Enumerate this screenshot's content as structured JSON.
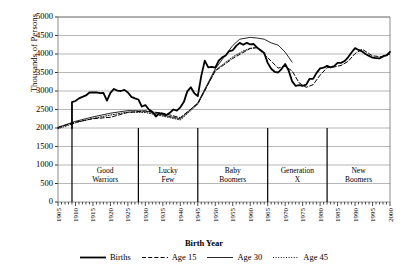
{
  "chart_data": {
    "type": "line",
    "title": "",
    "xlabel": "Birth Year",
    "ylabel": "Thousands of Persons",
    "xlim": [
      1905,
      2000
    ],
    "ylim": [
      0,
      5000
    ],
    "ytick_step": 500,
    "xtick_step": 5,
    "grid": true,
    "legend_position": "bottom",
    "yticks": [
      "0",
      "500",
      "1000",
      "1500",
      "2000",
      "2500",
      "3000",
      "3500",
      "4000",
      "4500",
      "5000"
    ],
    "xticks": [
      "1905",
      "1910",
      "1915",
      "1920",
      "1925",
      "1930",
      "1935",
      "1940",
      "1945",
      "1950",
      "1955",
      "1960",
      "1965",
      "1970",
      "1975",
      "1980",
      "1985",
      "1990",
      "1995",
      "2000"
    ],
    "legend": [
      {
        "name": "Births",
        "style": "solid-thick",
        "color": "#000000"
      },
      {
        "name": "Age 15",
        "style": "dashed",
        "color": "#000000"
      },
      {
        "name": "Age 30",
        "style": "solid-thin",
        "color": "#000000"
      },
      {
        "name": "Age 45",
        "style": "dotted",
        "color": "#000000"
      }
    ],
    "generation_bands": [
      {
        "label_line1": "Good",
        "label_line2": "Warriors",
        "start": 1909,
        "end": 1928
      },
      {
        "label_line1": "Lucky",
        "label_line2": "Few",
        "start": 1928,
        "end": 1945
      },
      {
        "label_line1": "Baby",
        "label_line2": "Boomers",
        "start": 1945,
        "end": 1965
      },
      {
        "label_line1": "Generation",
        "label_line2": "X",
        "start": 1965,
        "end": 1982
      },
      {
        "label_line1": "New",
        "label_line2": "Boomers",
        "start": 1982,
        "end": 2000
      }
    ],
    "series": [
      {
        "name": "Births",
        "style": "solid-thick",
        "x": [
          1909,
          1909,
          1910,
          1911,
          1912,
          1913,
          1914,
          1915,
          1916,
          1917,
          1918,
          1919,
          1920,
          1921,
          1922,
          1923,
          1924,
          1925,
          1926,
          1927,
          1928,
          1929,
          1930,
          1931,
          1932,
          1933,
          1934,
          1935,
          1936,
          1937,
          1938,
          1939,
          1940,
          1941,
          1942,
          1943,
          1944,
          1945,
          1946,
          1947,
          1948,
          1949,
          1950,
          1951,
          1952,
          1953,
          1954,
          1955,
          1956,
          1957,
          1958,
          1959,
          1960,
          1961,
          1962,
          1963,
          1964,
          1965,
          1966,
          1967,
          1968,
          1969,
          1970,
          1971,
          1972,
          1973,
          1974,
          1975,
          1976,
          1977,
          1978,
          1979,
          1980,
          1981,
          1982,
          1983,
          1984,
          1985,
          1986,
          1987,
          1988,
          1989,
          1990,
          1991,
          1992,
          1993,
          1994,
          1995,
          1996,
          1997,
          1998,
          1999,
          2000
        ],
        "y": [
          2000,
          2700,
          2730,
          2800,
          2840,
          2880,
          2960,
          2965,
          2960,
          2940,
          2950,
          2740,
          2950,
          3055,
          3010,
          3000,
          3030,
          2960,
          2840,
          2800,
          2770,
          2580,
          2620,
          2500,
          2440,
          2310,
          2400,
          2380,
          2350,
          2410,
          2500,
          2470,
          2560,
          2700,
          2990,
          3100,
          2940,
          2860,
          3410,
          3820,
          3640,
          3650,
          3630,
          3820,
          3910,
          3960,
          4080,
          4100,
          4220,
          4300,
          4250,
          4300,
          4260,
          4270,
          4170,
          4100,
          4030,
          3760,
          3600,
          3520,
          3500,
          3600,
          3730,
          3550,
          3260,
          3140,
          3160,
          3140,
          3170,
          3330,
          3330,
          3490,
          3610,
          3630,
          3680,
          3640,
          3670,
          3760,
          3760,
          3810,
          3910,
          4040,
          4160,
          4110,
          4070,
          4000,
          3950,
          3900,
          3890,
          3880,
          3940,
          3960,
          4060
        ],
        "note": "Total U.S. births by year, thousands"
      },
      {
        "name": "Age 15",
        "style": "dashed",
        "x": [
          1905,
          1910,
          1915,
          1920,
          1925,
          1930,
          1935,
          1940,
          1945,
          1950,
          1955,
          1960,
          1962,
          1965,
          1968,
          1970,
          1972,
          1974,
          1976,
          1978,
          1980,
          1982,
          1984,
          1986,
          1988,
          1990,
          1992,
          1995,
          1998,
          2000
        ],
        "y": [
          2010,
          2160,
          2250,
          2290,
          2420,
          2460,
          2400,
          2280,
          2660,
          3540,
          3880,
          4150,
          4170,
          3900,
          3620,
          3670,
          3540,
          3220,
          3100,
          3170,
          3430,
          3630,
          3650,
          3690,
          3800,
          4010,
          4130,
          3950,
          3920,
          4000
        ],
        "note": "Cohort size at age 15"
      },
      {
        "name": "Age 30",
        "style": "solid-thin",
        "x": [
          1905,
          1910,
          1915,
          1920,
          1925,
          1930,
          1935,
          1940,
          1945,
          1950,
          1953,
          1955,
          1957,
          1960,
          1962,
          1964,
          1966,
          1968,
          1970,
          1972
        ],
        "y": [
          2020,
          2180,
          2300,
          2400,
          2470,
          2460,
          2350,
          2250,
          2680,
          3600,
          3980,
          4230,
          4400,
          4450,
          4430,
          4400,
          4300,
          4240,
          4050,
          3780
        ],
        "note": "Cohort size at age 30"
      },
      {
        "name": "Age 45",
        "style": "dotted",
        "x": [
          1905,
          1910,
          1915,
          1920,
          1925,
          1930,
          1935,
          1940,
          1945,
          1950,
          1955,
          1958,
          1960,
          1962
        ],
        "y": [
          1980,
          2140,
          2260,
          2350,
          2430,
          2420,
          2320,
          2220,
          2640,
          3560,
          3920,
          4080,
          4150,
          4180
        ],
        "note": "Cohort size at age 45"
      }
    ]
  }
}
